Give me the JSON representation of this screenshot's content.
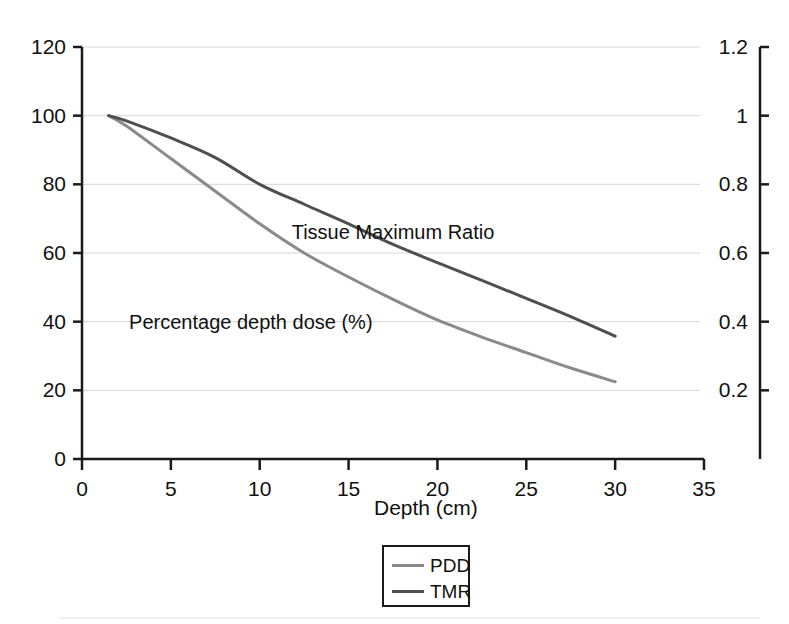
{
  "chart_data": {
    "type": "line",
    "title": "",
    "xlabel": "Depth (cm)",
    "ylabel_left": "",
    "ylabel_right": "",
    "xlim": [
      0,
      35
    ],
    "ylim_left": [
      0,
      120
    ],
    "ylim_right": [
      0,
      1.2
    ],
    "grid": true,
    "grid_axis": "y",
    "legend_position": "bottom-center",
    "x_ticks": [
      "0",
      "5",
      "10",
      "15",
      "20",
      "25",
      "30",
      "35"
    ],
    "x_tick_values": [
      0,
      5,
      10,
      15,
      20,
      25,
      30,
      35
    ],
    "y_ticks_left": [
      "120",
      "100",
      "80",
      "60",
      "40",
      "20",
      "0"
    ],
    "y_tick_values_left": [
      120,
      100,
      80,
      60,
      40,
      20,
      0
    ],
    "y_ticks_right": [
      "1.2",
      "1",
      "0.8",
      "0.6",
      "0.4",
      "0.2"
    ],
    "y_tick_values_right": [
      1.2,
      1.0,
      0.8,
      0.6,
      0.4,
      0.2
    ],
    "annotations": [
      {
        "text": "Tissue Maximum Ratio",
        "x": 17.5,
        "y": 66
      },
      {
        "text": "Percentage depth dose (%)",
        "x": 9.5,
        "y": 40
      }
    ],
    "series": [
      {
        "name": "PDD",
        "axis": "left",
        "color": "#8a8a8a",
        "x": [
          1.5,
          2.5,
          5,
          7.5,
          10,
          12.5,
          15,
          17.5,
          20,
          22.5,
          25,
          27.5,
          30
        ],
        "values": [
          100,
          97,
          87.5,
          78,
          68.5,
          60,
          53,
          46.5,
          40.5,
          35.5,
          31,
          26.5,
          22.5
        ]
      },
      {
        "name": "TMR",
        "axis": "right",
        "color": "#4f4f4f",
        "x": [
          1.5,
          2.5,
          5,
          7.5,
          10,
          12.5,
          15,
          17.5,
          20,
          22.5,
          25,
          27.5,
          30
        ],
        "values": [
          1.0,
          0.985,
          0.935,
          0.878,
          0.8,
          0.742,
          0.685,
          0.625,
          0.572,
          0.52,
          0.468,
          0.415,
          0.358
        ],
        "values_left_scale": [
          100,
          98.5,
          93.5,
          87.8,
          80,
          74.2,
          68.5,
          62.5,
          57.2,
          52,
          46.8,
          41.5,
          35.8
        ]
      }
    ]
  },
  "legend": {
    "items": [
      {
        "label": "PDD",
        "color": "#8a8a8a"
      },
      {
        "label": "TMR",
        "color": "#4f4f4f"
      }
    ]
  },
  "axes": {
    "x_title": "Depth (cm)"
  },
  "colors": {
    "axis": "#1a1a1a",
    "grid": "#d6d6d6",
    "text": "#111111",
    "pdd": "#8a8a8a",
    "tmr": "#4f4f4f",
    "background": "#ffffff"
  }
}
